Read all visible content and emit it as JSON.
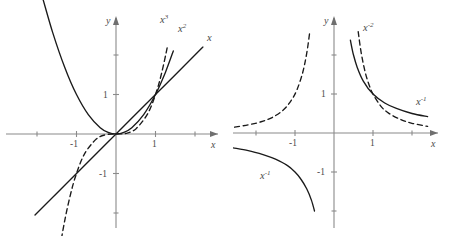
{
  "figure": {
    "title": "",
    "background_color": "#ffffff",
    "curve_color": "#1a1a1a",
    "axis_color": "#8a8a8a",
    "text_color": "#4a4a4a"
  },
  "panels": [
    {
      "id": "left",
      "name": "positive-power-functions",
      "axis_x_label": "x",
      "axis_y_label": "y",
      "x_ticks": [
        {
          "value": -1,
          "label": "-1"
        },
        {
          "value": 1,
          "label": "1"
        }
      ],
      "y_ticks": [
        {
          "value": -1,
          "label": "-1"
        },
        {
          "value": 1,
          "label": "1"
        }
      ],
      "curves": [
        {
          "name": "x-cubed",
          "label_base": "x",
          "label_exponent": "3",
          "style": "dashed"
        },
        {
          "name": "x-squared",
          "label_base": "x",
          "label_exponent": "2",
          "style": "solid"
        },
        {
          "name": "x-linear",
          "label_base": "x",
          "label_exponent": "",
          "style": "solid"
        }
      ]
    },
    {
      "id": "right",
      "name": "negative-power-functions",
      "axis_x_label": "x",
      "axis_y_label": "y",
      "x_ticks": [
        {
          "value": -1,
          "label": "-1"
        },
        {
          "value": 1,
          "label": "1"
        }
      ],
      "y_ticks": [
        {
          "value": -1,
          "label": "-1"
        },
        {
          "value": 1,
          "label": "1"
        }
      ],
      "curves": [
        {
          "name": "x-to-minus-two",
          "label_base": "x",
          "label_exponent": "-2",
          "style": "dashed"
        },
        {
          "name": "x-to-minus-one-right",
          "label_base": "x",
          "label_exponent": "-1",
          "style": "solid"
        },
        {
          "name": "x-to-minus-one-left",
          "label_base": "x",
          "label_exponent": "-1",
          "style": "solid"
        }
      ]
    }
  ],
  "chart_data": [
    {
      "type": "line",
      "title": "",
      "xlabel": "x",
      "ylabel": "y",
      "xlim": [
        -2.7,
        2.6
      ],
      "ylim": [
        -2.8,
        2.4
      ],
      "grid": false,
      "legend": "inline-curve-labels",
      "xticks": [
        -1,
        1
      ],
      "xticklabels": [
        "-1",
        "1"
      ],
      "yticks": [
        -1,
        1
      ],
      "yticklabels": [
        "-1",
        "1"
      ],
      "series": [
        {
          "name": "x^2",
          "label": "x²",
          "style": "solid",
          "x": [
            -1.85,
            -1.6,
            -1.3,
            -1.0,
            -0.7,
            -0.4,
            -0.2,
            0,
            0.2,
            0.4,
            0.7,
            1.0,
            1.25,
            1.45
          ],
          "y": [
            3.42,
            2.56,
            1.69,
            1.0,
            0.49,
            0.16,
            0.04,
            0,
            0.04,
            0.16,
            0.49,
            1.0,
            1.56,
            2.1
          ]
        },
        {
          "name": "x^3",
          "label": "x³",
          "style": "dashed",
          "x": [
            -1.42,
            -1.3,
            -1.15,
            -1.0,
            -0.8,
            -0.5,
            -0.25,
            0,
            0.25,
            0.5,
            0.8,
            1.0,
            1.15,
            1.3
          ],
          "y": [
            -2.87,
            -2.2,
            -1.52,
            -1.0,
            -0.51,
            -0.13,
            -0.016,
            0,
            0.016,
            0.13,
            0.51,
            1.0,
            1.52,
            2.2
          ]
        },
        {
          "name": "x",
          "label": "x",
          "style": "solid",
          "x": [
            -2.05,
            -1.0,
            0,
            1.0,
            2.2
          ],
          "y": [
            -2.05,
            -1.0,
            0,
            1.0,
            2.2
          ]
        }
      ],
      "annotations": [
        {
          "text": "x³",
          "x": 1.15,
          "y": 2.55
        },
        {
          "text": "x²",
          "x": 1.55,
          "y": 2.45
        },
        {
          "text": "x",
          "x": 2.35,
          "y": 2.1
        }
      ],
      "intersection_points": [
        [
          0,
          0
        ],
        [
          1,
          1
        ]
      ]
    },
    {
      "type": "line",
      "title": "",
      "xlabel": "x",
      "ylabel": "y",
      "xlim": [
        -2.7,
        2.6
      ],
      "ylim": [
        -2.8,
        2.4
      ],
      "grid": false,
      "legend": "inline-curve-labels",
      "xticks": [
        -1,
        1
      ],
      "xticklabels": [
        "-1",
        "1"
      ],
      "yticks": [
        -1,
        1
      ],
      "yticklabels": [
        "-1",
        "1"
      ],
      "series": [
        {
          "name": "x^-2 (x>0)",
          "label": "x⁻²",
          "style": "dashed",
          "x": [
            0.62,
            0.7,
            0.8,
            0.9,
            1.0,
            1.2,
            1.4,
            1.7,
            2.0,
            2.4
          ],
          "y": [
            2.6,
            2.04,
            1.56,
            1.23,
            1.0,
            0.69,
            0.51,
            0.35,
            0.25,
            0.17
          ]
        },
        {
          "name": "x^-2 (x<0)",
          "label": "x⁻²",
          "style": "dashed",
          "x": [
            -2.55,
            -2.2,
            -1.9,
            -1.6,
            -1.3,
            -1.1,
            -0.95,
            -0.8,
            -0.7,
            -0.62
          ],
          "y": [
            0.15,
            0.21,
            0.28,
            0.39,
            0.59,
            0.83,
            1.11,
            1.56,
            2.04,
            2.6
          ]
        },
        {
          "name": "x^-1 (x>0)",
          "label": "x⁻¹",
          "style": "solid",
          "x": [
            0.42,
            0.5,
            0.6,
            0.75,
            1.0,
            1.3,
            1.6,
            2.0,
            2.4
          ],
          "y": [
            2.38,
            2.0,
            1.67,
            1.33,
            1.0,
            0.77,
            0.63,
            0.5,
            0.42
          ]
        },
        {
          "name": "x^-1 (x<0)",
          "label": "x⁻¹",
          "style": "solid",
          "x": [
            -2.6,
            -2.2,
            -1.8,
            -1.5,
            -1.2,
            -1.0,
            -0.85,
            -0.7,
            -0.58,
            -0.5
          ],
          "y": [
            -0.38,
            -0.45,
            -0.56,
            -0.67,
            -0.83,
            -1.0,
            -1.18,
            -1.43,
            -1.72,
            -2.0
          ]
        }
      ],
      "annotations": [
        {
          "text": "x⁻²",
          "x": 1.15,
          "y": 2.4
        },
        {
          "text": "x⁻¹",
          "x": 2.05,
          "y": 0.82
        },
        {
          "text": "x⁻¹",
          "x": -1.55,
          "y": -1.2
        }
      ],
      "intersection_points": [
        [
          1,
          1
        ]
      ]
    }
  ]
}
